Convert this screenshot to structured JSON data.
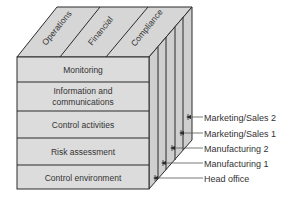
{
  "diagram": {
    "type": "coso-cube",
    "colors": {
      "face_fill": "#dcdcdc",
      "top_fill": "#d6d6d6",
      "side_fill": "#cfcfcf",
      "stroke": "#2a2a2a",
      "text": "#333333"
    },
    "top_objectives": [
      {
        "label": "Operations"
      },
      {
        "label": "Financial"
      },
      {
        "label": "Compliance"
      }
    ],
    "front_components": [
      {
        "label": "Monitoring"
      },
      {
        "label_line1": "Information and",
        "label_line2": "communications"
      },
      {
        "label": "Control activities"
      },
      {
        "label": "Risk assessment"
      },
      {
        "label": "Control environment"
      }
    ],
    "side_units": [
      {
        "label": "Marketing/Sales 2"
      },
      {
        "label": "Marketing/Sales 1"
      },
      {
        "label": "Manufacturing 2"
      },
      {
        "label": "Manufacturing 1"
      },
      {
        "label": "Head office"
      }
    ]
  }
}
